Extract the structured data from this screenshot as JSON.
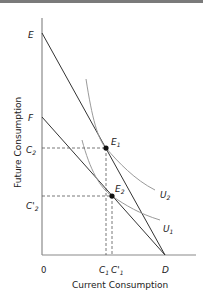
{
  "diagram": {
    "y_axis_label": "Future Consumption",
    "x_axis_label": "Current Consumption",
    "origin_label": "0",
    "points": {
      "E": "E",
      "F": "F",
      "D": "D",
      "E1": {
        "base": "E",
        "sub": "1"
      },
      "E2": {
        "base": "E",
        "sub": "2"
      }
    },
    "y_ticks": {
      "C2": {
        "base": "C",
        "sub": "2"
      },
      "C2_prime": {
        "base": "C'",
        "sub": "2"
      }
    },
    "x_ticks": {
      "C1": {
        "base": "C",
        "sub": "1"
      },
      "C1_prime": {
        "base": "C'",
        "sub": "1"
      }
    },
    "curves": {
      "U1": {
        "base": "U",
        "sub": "1"
      },
      "U2": {
        "base": "U",
        "sub": "2"
      }
    },
    "colors": {
      "axis": "#8a8a8a",
      "budget_line": "#333333",
      "indifference_curve": "#9a9a9a",
      "dashed": "#555555",
      "point": "#111111"
    }
  }
}
